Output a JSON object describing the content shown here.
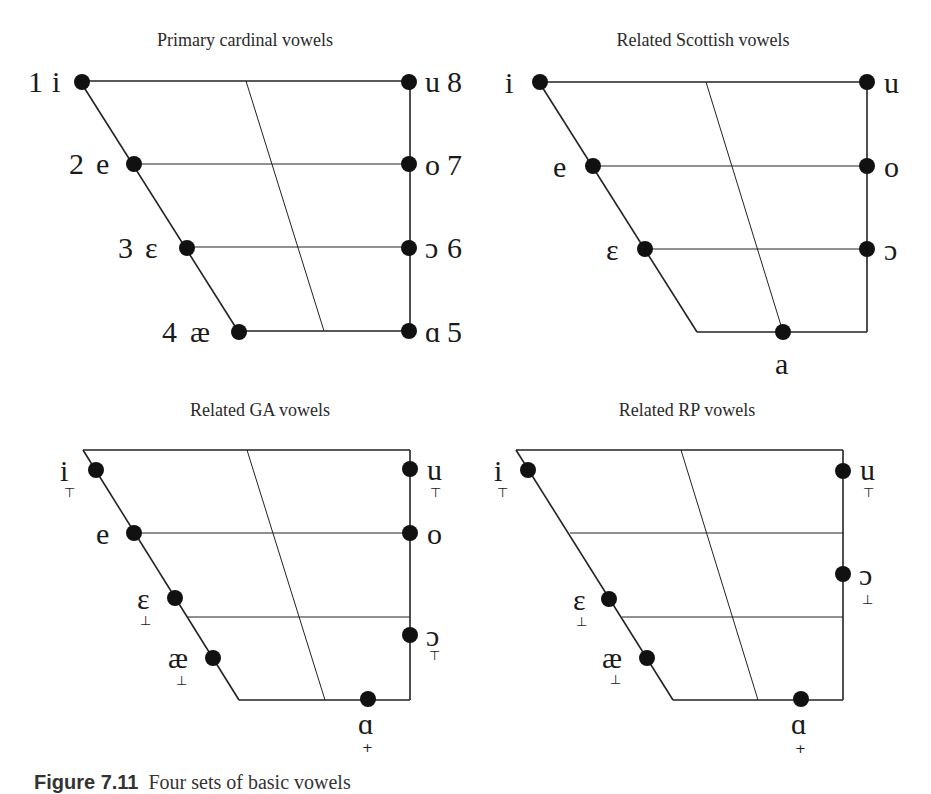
{
  "figure": {
    "caption_label": "Figure 7.11",
    "caption_text": "Four sets of basic vowels"
  },
  "panels": [
    {
      "title": "Primary cardinal vowels",
      "vowels": [
        {
          "symbol": "i",
          "number": "1",
          "side": "front",
          "height": "close"
        },
        {
          "symbol": "e",
          "number": "2",
          "side": "front",
          "height": "close-mid"
        },
        {
          "symbol": "ɛ",
          "number": "3",
          "side": "front",
          "height": "open-mid"
        },
        {
          "symbol": "æ",
          "number": "4",
          "side": "front",
          "height": "open"
        },
        {
          "symbol": "ɑ",
          "number": "5",
          "side": "back",
          "height": "open"
        },
        {
          "symbol": "ɔ",
          "number": "6",
          "side": "back",
          "height": "open-mid"
        },
        {
          "symbol": "o",
          "number": "7",
          "side": "back",
          "height": "close-mid"
        },
        {
          "symbol": "u",
          "number": "8",
          "side": "back",
          "height": "close"
        }
      ]
    },
    {
      "title": "Related Scottish vowels",
      "vowels": [
        {
          "symbol": "i"
        },
        {
          "symbol": "e"
        },
        {
          "symbol": "ɛ"
        },
        {
          "symbol": "a"
        },
        {
          "symbol": "ɔ"
        },
        {
          "symbol": "o"
        },
        {
          "symbol": "u"
        }
      ]
    },
    {
      "title": "Related GA vowels",
      "vowels": [
        {
          "symbol": "i",
          "diacritic": "˕"
        },
        {
          "symbol": "e"
        },
        {
          "symbol": "ɛ",
          "diacritic": "˔"
        },
        {
          "symbol": "æ",
          "diacritic": "˔"
        },
        {
          "symbol": "ɑ",
          "diacritic": "˖"
        },
        {
          "symbol": "ɔ",
          "diacritic": "˕"
        },
        {
          "symbol": "o"
        },
        {
          "symbol": "u",
          "diacritic": "˕"
        }
      ]
    },
    {
      "title": "Related RP vowels",
      "vowels": [
        {
          "symbol": "i",
          "diacritic": "˕"
        },
        {
          "symbol": "ɛ",
          "diacritic": "˔"
        },
        {
          "symbol": "æ",
          "diacritic": "˔"
        },
        {
          "symbol": "ɑ",
          "diacritic": "˖"
        },
        {
          "symbol": "ɔ",
          "diacritic": "˔˒"
        },
        {
          "symbol": "u",
          "diacritic": "˕"
        }
      ]
    }
  ],
  "labels": {
    "p1_1": "1",
    "p1_i": "i",
    "p1_2": "2",
    "p1_e": "e",
    "p1_3": "3",
    "p1_eps": "ɛ",
    "p1_4": "4",
    "p1_ae": "æ",
    "p1_u": "u",
    "p1_8": "8",
    "p1_o": "o",
    "p1_7": "7",
    "p1_oo": "ɔ",
    "p1_6": "6",
    "p1_a": "ɑ",
    "p1_5": "5",
    "p2_i": "i",
    "p2_e": "e",
    "p2_eps": "ɛ",
    "p2_a": "a",
    "p2_u": "u",
    "p2_o": "o",
    "p2_oo": "ɔ",
    "p3_i": "i",
    "p3_e": "e",
    "p3_eps": "ɛ",
    "p3_ae": "æ",
    "p3_a": "ɑ",
    "p3_oo": "ɔ",
    "p3_o": "o",
    "p3_u": "u",
    "p4_i": "i",
    "p4_eps": "ɛ",
    "p4_ae": "æ",
    "p4_a": "ɑ",
    "p4_oo": "ɔ",
    "p4_u": "u",
    "d_lower": "⊤",
    "d_raise": "⊥",
    "d_adv": "+",
    "d_lower_round": "⊤"
  }
}
